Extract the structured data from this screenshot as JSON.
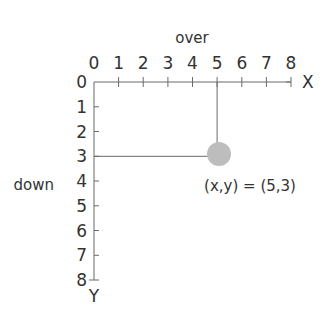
{
  "diagram": {
    "top_label": "over",
    "left_label": "down",
    "x_axis_name": "X",
    "y_axis_name": "Y",
    "x_ticks": [
      "0",
      "1",
      "2",
      "3",
      "4",
      "5",
      "6",
      "7",
      "8"
    ],
    "y_ticks": [
      "0",
      "1",
      "2",
      "3",
      "4",
      "5",
      "6",
      "7",
      "8"
    ],
    "point": {
      "x": 5,
      "y": 3,
      "color": "#bdbdbd"
    },
    "point_label": "(x,y) = (5,3)",
    "line_color": "#6a6a6a"
  }
}
